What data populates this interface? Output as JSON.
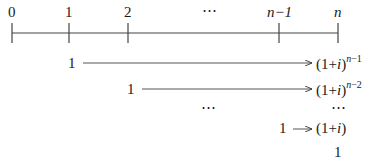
{
  "timeline": {
    "ticks": [
      {
        "label": "0",
        "x": 12
      },
      {
        "label": "1",
        "x": 69
      },
      {
        "label": "2",
        "x": 128
      },
      {
        "label": "n−1",
        "x": 279
      },
      {
        "label": "n",
        "x": 338
      }
    ],
    "ellipsis": "⋯"
  },
  "rows": [
    {
      "start": "1",
      "base": "(1+",
      "var": "i",
      "close": ")",
      "exponent_var": "n",
      "exponent_rest": "−1"
    },
    {
      "start": "1",
      "base": "(1+",
      "var": "i",
      "close": ")",
      "exponent_var": "n",
      "exponent_rest": "−2"
    },
    {
      "ellipsis_left": "⋯",
      "ellipsis_right": "⋯"
    },
    {
      "start": "1",
      "base": "(1+",
      "var": "i",
      "close": ")"
    },
    {
      "end": "1"
    }
  ]
}
